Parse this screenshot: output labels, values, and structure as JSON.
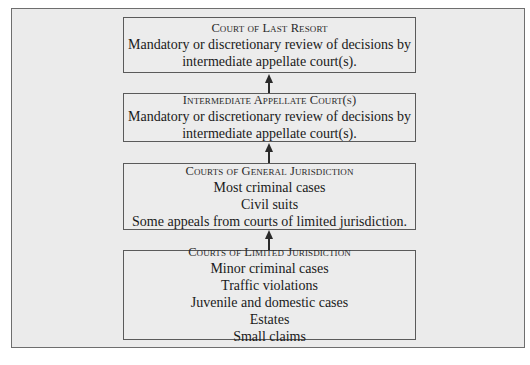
{
  "diagram": {
    "type": "hierarchy-flowchart",
    "direction": "bottom-to-top",
    "boxes": [
      {
        "title": "Court of Last Resort",
        "lines": [
          "Mandatory or discretionary review of decisions by",
          "intermediate appellate court(s)."
        ]
      },
      {
        "title": "Intermediate Appellate Court(s)",
        "lines": [
          "Mandatory or discretionary review of decisions by",
          "intermediate appellate court(s)."
        ]
      },
      {
        "title": "Courts of General Jurisdiction",
        "lines": [
          "Most criminal cases",
          "Civil suits",
          "Some appeals from courts of limited jurisdiction."
        ]
      },
      {
        "title": "Courts of Limited Jurisdiction",
        "lines": [
          "Minor criminal cases",
          "Traffic violations",
          "Juvenile and domestic cases",
          "Estates",
          "Small claims"
        ]
      }
    ],
    "edges": [
      {
        "from": "Courts of Limited Jurisdiction",
        "to": "Courts of General Jurisdiction"
      },
      {
        "from": "Courts of General Jurisdiction",
        "to": "Intermediate Appellate Court(s)"
      },
      {
        "from": "Intermediate Appellate Court(s)",
        "to": "Court of Last Resort"
      }
    ],
    "colors": {
      "background": "#ebebeb",
      "border": "#5a5a5a",
      "text": "#1a1a1a"
    }
  }
}
